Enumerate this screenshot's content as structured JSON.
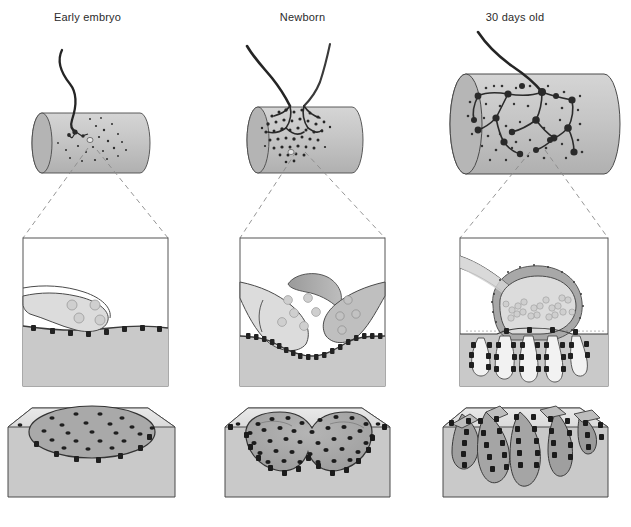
{
  "figure": {
    "kind": "scientific-diagram",
    "columns": [
      {
        "id": "early-embryo",
        "label": "Early embryo",
        "stage_index": 1,
        "fiber": {
          "description": "Thin muscle fiber cylinder with a single fine axon contacting it",
          "axon_count": 1,
          "terminal_description": "small simple nerve ending with sparse scattered receptor dots",
          "receptor_distribution": "diffuse, scattered over the fiber surface"
        },
        "detail": {
          "description": "Single nerve terminal with few synaptic vesicles resting on a flat muscle membrane",
          "terminals": 1,
          "vesicle_count": 4,
          "schwann_cell": false,
          "junctional_folds": false,
          "basal_lamina": false,
          "receptor_clusters": 8,
          "receptor_density": "low"
        },
        "surface": {
          "description": "Oval plaque of sparsely scattered acetylcholine receptors on a flat muscle surface",
          "shape": "oval plaque",
          "receptor_count": 30,
          "receptor_density": "sparse",
          "folds": 0
        }
      },
      {
        "id": "newborn",
        "label": "Newborn",
        "stage_index": 2,
        "fiber": {
          "description": "Muscle fiber cylinder innervated by two converging axons",
          "axon_count": 2,
          "terminal_description": "dense stippled plaque formed by two competing terminals",
          "receptor_distribution": "concentrated into a single dense plaque"
        },
        "detail": {
          "description": "Two competing nerve terminals capped by a Schwann cell over a slightly depressed muscle membrane",
          "terminals": 2,
          "vesicle_count": 10,
          "schwann_cell": true,
          "junctional_folds": false,
          "basal_lamina": false,
          "receptor_clusters": 26,
          "receptor_density": "medium"
        },
        "surface": {
          "description": "Pretzel-shaped depression densely packed with acetylcholine receptors",
          "shape": "shallow pretzel-shaped gutter",
          "receptor_count": 80,
          "receptor_density": "dense",
          "folds": 0
        }
      },
      {
        "id": "30-days-old",
        "label": "30 days old",
        "stage_index": 3,
        "fiber": {
          "description": "Enlarged muscle fiber with one axon forming an elaborate branched pretzel arborization",
          "axon_count": 1,
          "terminal_description": "highly branched terminal arbor with many synaptic boutons",
          "receptor_distribution": "restricted to the branched endplate"
        },
        "detail": {
          "description": "Mature synapse: single terminal with clustered vesicles at active zones, Schwann cell cap, basal lamina and deep junctional folds",
          "terminals": 1,
          "vesicle_count": 20,
          "schwann_cell": true,
          "junctional_folds": true,
          "fold_count": 4,
          "basal_lamina": true,
          "active_zones": 4,
          "receptor_clusters": 40,
          "receptor_density": "very high, concentrated at fold crests"
        },
        "surface": {
          "description": "Deep junctional folds with acetylcholine receptors lining the crests of each fold",
          "shape": "branched gutter with deep folds",
          "receptor_count": 90,
          "receptor_density": "very dense along fold crests",
          "folds": 5
        }
      }
    ],
    "legend_items": [
      {
        "name": "acetylcholine-receptor",
        "appearance": "small dark square or dot"
      },
      {
        "name": "synaptic-vesicle",
        "appearance": "small pale grey circle"
      },
      {
        "name": "schwann-cell",
        "appearance": "mid-grey cap over the terminal"
      },
      {
        "name": "muscle-fiber",
        "appearance": "light grey shaded region"
      },
      {
        "name": "axon",
        "appearance": "dark curved line"
      },
      {
        "name": "basal-lamina",
        "appearance": "fine stippled line in the synaptic cleft"
      }
    ],
    "colors": {
      "muscle_fill": "#c9c9c9",
      "terminal_fill": "#dcdcdc",
      "schwann_fill": "#a8a8a8",
      "receptor": "#2a2a2a",
      "vesicle": "#cfcfcf",
      "outline": "#4a4a4a",
      "panel_border": "#555555",
      "background": "#ffffff",
      "dashed_leader": "#777777"
    }
  }
}
